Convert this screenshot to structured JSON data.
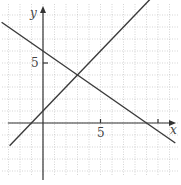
{
  "chart_data": {
    "type": "line",
    "title": "",
    "xlabel": "x",
    "ylabel": "y",
    "xlim": [
      -3.7,
      11.5
    ],
    "ylim": [
      -5,
      10
    ],
    "grid": true,
    "tick_labels": {
      "x": [
        "5"
      ],
      "y": [
        "5"
      ]
    },
    "x_ticks": [
      5,
      10
    ],
    "y_ticks": [
      5
    ],
    "series": [
      {
        "name": "line-decreasing",
        "equation": "y = -2/3 x + 6",
        "points": [
          [
            -3.6,
            8.4
          ],
          [
            11.5,
            -1.67
          ]
        ]
      },
      {
        "name": "line-increasing",
        "equation": "y = x + 1",
        "points": [
          [
            -2.9,
            -1.9
          ],
          [
            10.2,
            11.2
          ]
        ]
      }
    ],
    "annotations": [
      {
        "text": "intersection",
        "x": 3,
        "y": 4
      }
    ]
  },
  "labels": {
    "x_axis": "x",
    "y_axis": "y",
    "x_tick_5": "5",
    "y_tick_5": "5"
  }
}
